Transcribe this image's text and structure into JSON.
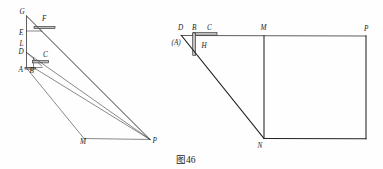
{
  "figure": {
    "caption": "图46",
    "caption_number": "46",
    "background_color": "#fefefe",
    "line_color": "#2a2a2a",
    "bar_color": "#bfbfbf",
    "label_color": "#1b1b1b"
  },
  "left_diagram": {
    "name": "left-figure",
    "labels": [
      {
        "id": "G",
        "text": "G",
        "x": 19.5,
        "y": 13.5
      },
      {
        "id": "F",
        "text": "F",
        "x": 42.0,
        "y": 21.0
      },
      {
        "id": "E",
        "text": "E",
        "x": 19.0,
        "y": 34.5
      },
      {
        "id": "L",
        "text": "L",
        "x": 19.5,
        "y": 46.0
      },
      {
        "id": "D",
        "text": "D",
        "x": 18.5,
        "y": 54.0
      },
      {
        "id": "C",
        "text": "C",
        "x": 43.0,
        "y": 56.5
      },
      {
        "id": "A",
        "text": "A",
        "x": 18.5,
        "y": 72.0
      },
      {
        "id": "B",
        "text": "B",
        "x": 29.5,
        "y": 72.5
      },
      {
        "id": "M",
        "text": "M",
        "x": 80.0,
        "y": 144.0
      },
      {
        "id": "P",
        "text": "P",
        "x": 152.5,
        "y": 143.0
      }
    ],
    "points": {
      "G": [
        26.5,
        16.0
      ],
      "F": [
        40.0,
        27.0
      ],
      "E": [
        26.5,
        31.0
      ],
      "L": [
        26.5,
        44.5
      ],
      "D": [
        26.5,
        52.5
      ],
      "C": [
        41.0,
        61.5
      ],
      "A": [
        26.5,
        67.5
      ],
      "B": [
        33.5,
        67.5
      ],
      "M": [
        84.0,
        138.5
      ],
      "P": [
        150.0,
        139.5
      ]
    }
  },
  "right_diagram": {
    "name": "right-figure",
    "labels": [
      {
        "id": "D",
        "text": "D",
        "x": 178.0,
        "y": 30.0
      },
      {
        "id": "A",
        "text": "(A)",
        "x": 173.0,
        "y": 43.5
      },
      {
        "id": "B",
        "text": "B",
        "x": 192.0,
        "y": 30.0
      },
      {
        "id": "C",
        "text": "C",
        "x": 207.0,
        "y": 29.5
      },
      {
        "id": "H",
        "text": "H",
        "x": 201.5,
        "y": 48.0
      },
      {
        "id": "M",
        "text": "M",
        "x": 260.5,
        "y": 30.0
      },
      {
        "id": "P",
        "text": "P",
        "x": 365.0,
        "y": 31.0
      },
      {
        "id": "N",
        "text": "N",
        "x": 257.5,
        "y": 147.5
      }
    ],
    "points": {
      "D": [
        181.0,
        35.5
      ],
      "B": [
        194.0,
        35.5
      ],
      "C": [
        211.0,
        35.5
      ],
      "H": [
        198.0,
        46.0
      ],
      "M": [
        264.0,
        35.5
      ],
      "P": [
        366.0,
        36.0
      ],
      "N": [
        264.0,
        138.5
      ]
    }
  }
}
